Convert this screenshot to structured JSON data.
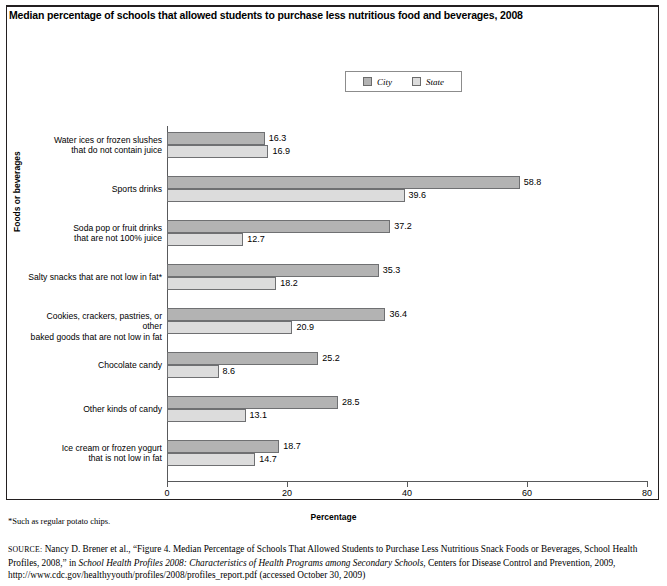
{
  "figure": {
    "title": "Median percentage of schools that allowed students to purchase less nutritious food and beverages, 2008",
    "footnote": "*Such as regular potato chips.",
    "source_prefix": "SOURCE:",
    "source_part1": " Nancy D. Brener et al., “Figure 4. Median Percentage of Schools That Allowed Students to Purchase Less Nutritious Snack Foods or Beverages, School Health Profiles, 2008,” in ",
    "source_italic": "School Health Profiles 2008: Characteristics of Health Programs among Secondary Schools",
    "source_part2": ", Centers for Disease Control and Prevention, 2009, http://www.cdc.gov/healthyyouth/profiles/2008/profiles_report.pdf (accessed October 30, 2009)"
  },
  "legend": {
    "position": "top-center",
    "entries": [
      {
        "label": "City",
        "color": "#b3b3b3"
      },
      {
        "label": "State",
        "color": "#dcdcdc"
      }
    ]
  },
  "chart_data": {
    "type": "bar",
    "orientation": "horizontal",
    "title": "Median percentage of schools that allowed students to purchase less nutritious food and beverages, 2008",
    "xlabel": "Percentage",
    "ylabel": "Foods or beverages",
    "xlim": [
      0,
      80
    ],
    "xticks": [
      0,
      20,
      40,
      60,
      80
    ],
    "xtick_labels": [
      "0",
      "20",
      "40",
      "60",
      "80"
    ],
    "grid": false,
    "legend_position": "top-center",
    "categories": [
      "Water ices or frozen slushes\nthat do not contain juice",
      "Sports drinks",
      "Soda pop or fruit drinks\nthat are not 100% juice",
      "Salty snacks that are not low in fat*",
      "Cookies, crackers, pastries, or other\nbaked goods that are not low in fat",
      "Chocolate candy",
      "Other kinds of candy",
      "Ice cream or frozen yogurt\nthat is not low in fat"
    ],
    "series": [
      {
        "name": "City",
        "color": "#b3b3b3",
        "values": [
          16.3,
          58.8,
          37.2,
          35.3,
          36.4,
          25.2,
          28.5,
          18.7
        ],
        "labels": [
          "16.3",
          "58.8",
          "37.2",
          "35.3",
          "36.4",
          "25.2",
          "28.5",
          "18.7"
        ]
      },
      {
        "name": "State",
        "color": "#dcdcdc",
        "values": [
          16.9,
          39.6,
          12.7,
          18.2,
          20.9,
          8.6,
          13.1,
          14.7
        ],
        "labels": [
          "16.9",
          "39.6",
          "12.7",
          "18.2",
          "20.9",
          "8.6",
          "13.1",
          "14.7"
        ]
      }
    ]
  }
}
